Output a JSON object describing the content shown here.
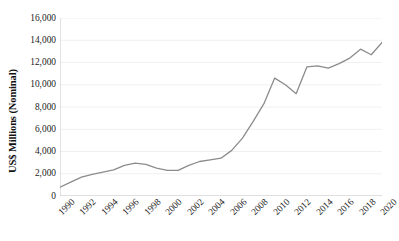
{
  "chart_data": {
    "type": "line",
    "title": "",
    "subtitle": "",
    "xlabel": "",
    "ylabel": "US$ Millions (Nominal)",
    "x": [
      1990,
      1991,
      1992,
      1993,
      1994,
      1995,
      1996,
      1997,
      1998,
      1999,
      2000,
      2001,
      2002,
      2003,
      2004,
      2005,
      2006,
      2007,
      2008,
      2009,
      2010,
      2011,
      2012,
      2013,
      2014,
      2015,
      2016,
      2017,
      2018,
      2019,
      2020
    ],
    "values": [
      800,
      1250,
      1700,
      1950,
      2150,
      2350,
      2750,
      2950,
      2850,
      2500,
      2300,
      2300,
      2750,
      3100,
      3250,
      3400,
      4100,
      5200,
      6700,
      8300,
      10600,
      10000,
      9200,
      11600,
      11700,
      11500,
      11900,
      12400,
      13200,
      12700,
      13800
    ],
    "series": [
      {
        "name": "US$ Millions (Nominal)",
        "color": "#8C8C8C",
        "values": [
          800,
          1250,
          1700,
          1950,
          2150,
          2350,
          2750,
          2950,
          2850,
          2500,
          2300,
          2300,
          2750,
          3100,
          3250,
          3400,
          4100,
          5200,
          6700,
          8300,
          10600,
          10000,
          9200,
          11600,
          11700,
          11500,
          11900,
          12400,
          13200,
          12700,
          13800
        ]
      }
    ],
    "xlim": [
      1990,
      2020
    ],
    "ylim": [
      0,
      16000
    ],
    "ytick_values": [
      0,
      2000,
      4000,
      6000,
      8000,
      10000,
      12000,
      14000,
      16000
    ],
    "ytick_labels": [
      "0",
      "2,000",
      "4,000",
      "6,000",
      "8,000",
      "10,000",
      "12,000",
      "14,000",
      "16,000"
    ],
    "xtick_values": [
      1990,
      1992,
      1994,
      1996,
      1998,
      2000,
      2002,
      2004,
      2006,
      2008,
      2010,
      2012,
      2014,
      2016,
      2018,
      2020
    ],
    "xtick_labels": [
      "1990",
      "1992",
      "1994",
      "1996",
      "1998",
      "2000",
      "2002",
      "2004",
      "2006",
      "2008",
      "2010",
      "2012",
      "2014",
      "2016",
      "2018",
      "2020"
    ],
    "grid": {
      "horizontal": true,
      "vertical": false,
      "color": "#ECECEC"
    },
    "legend": {
      "visible": false,
      "position": "none"
    },
    "line_width": 1.3,
    "markers": false,
    "background_color": "#FFFFFF",
    "axis_color": "#BFBFBF"
  }
}
